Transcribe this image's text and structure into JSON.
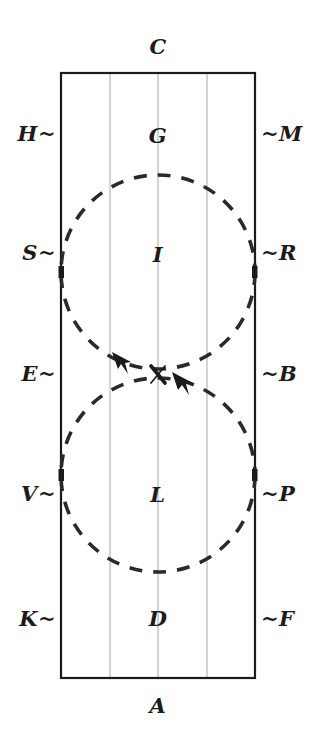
{
  "figure": {
    "title": "",
    "type": "line-diagram",
    "background_color": "#ffffff",
    "ink_color": "#1b1b1b",
    "gridline_color": "#c9c9c9",
    "rectangle": {
      "left": 61,
      "top": 73,
      "right": 255,
      "bottom": 678,
      "stroke_width": 2.2
    },
    "gridlines_x": [
      110,
      158,
      207
    ],
    "circles": [
      {
        "name": "upper-circle",
        "cx": 158,
        "cy": 272,
        "r": 97,
        "dashed": true
      },
      {
        "name": "lower-circle",
        "cx": 158,
        "cy": 475,
        "r": 97,
        "dashed": true
      }
    ],
    "crossing_point": {
      "x": 158,
      "y": 374,
      "marker": "x"
    },
    "arrows": [
      {
        "name": "arrow-upper-left",
        "tip_x": 116,
        "tip_y": 355,
        "angle_deg": 222
      },
      {
        "name": "arrow-lower-right",
        "tip_x": 198,
        "tip_y": 382,
        "angle_deg": 218
      }
    ]
  },
  "labels": {
    "top": {
      "text": "C",
      "x": 158,
      "y": 46
    },
    "bottom": {
      "text": "A",
      "x": 158,
      "y": 705
    },
    "left": [
      {
        "text": "H~",
        "x": 56,
        "y": 133
      },
      {
        "text": "S~",
        "x": 56,
        "y": 252
      },
      {
        "text": "E~",
        "x": 56,
        "y": 373
      },
      {
        "text": "V~",
        "x": 56,
        "y": 493
      },
      {
        "text": "K~",
        "x": 56,
        "y": 618
      }
    ],
    "right": [
      {
        "text": "~M",
        "x": 261,
        "y": 133
      },
      {
        "text": "~R",
        "x": 261,
        "y": 252
      },
      {
        "text": "~B",
        "x": 261,
        "y": 373
      },
      {
        "text": "~P",
        "x": 261,
        "y": 493
      },
      {
        "text": "~F",
        "x": 261,
        "y": 618
      }
    ],
    "interior": [
      {
        "text": "G",
        "x": 158,
        "y": 135
      },
      {
        "text": "I",
        "x": 158,
        "y": 254
      },
      {
        "text": "L",
        "x": 158,
        "y": 494
      },
      {
        "text": "D",
        "x": 158,
        "y": 618
      }
    ]
  }
}
